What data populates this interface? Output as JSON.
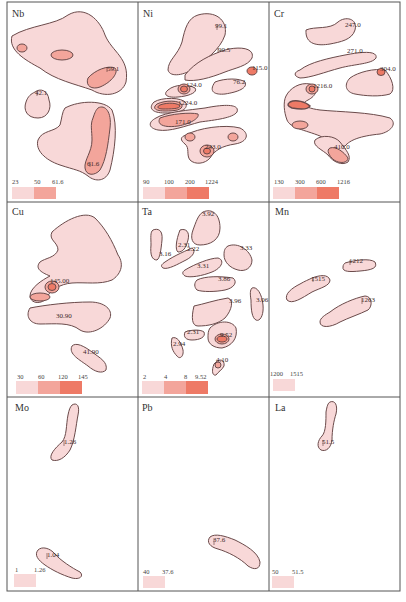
{
  "figure": {
    "grid": {
      "rows": 3,
      "cols": 3
    },
    "colors": {
      "level1": "#f8d8d8",
      "level2": "#f3a59b",
      "level3": "#ee7a66",
      "outline": "#6a4a4a",
      "frame": "#555555"
    },
    "panels": [
      {
        "element": "Nb",
        "legend": [
          "23",
          "50",
          "61.6"
        ],
        "values": [
          "42.1",
          "59.1",
          "61.6"
        ]
      },
      {
        "element": "Ni",
        "legend": [
          "90",
          "100",
          "200",
          "1224"
        ],
        "values": [
          "99.1",
          "90.5",
          "115.0",
          "76.2",
          "124.0",
          "1224.0",
          "171.0",
          "243.0"
        ]
      },
      {
        "element": "Cr",
        "legend": [
          "130",
          "300",
          "600",
          "1216"
        ],
        "values": [
          "247.0",
          "271.0",
          "304.0",
          "1216.0",
          "410.0"
        ]
      },
      {
        "element": "Cu",
        "legend": [
          "30",
          "60",
          "120",
          "145"
        ],
        "values": [
          "145.00",
          "30.90",
          "41.90"
        ]
      },
      {
        "element": "Ta",
        "legend": [
          "2",
          "4",
          "8",
          "9.52"
        ],
        "values": [
          "3.92",
          "2.31",
          "2.22",
          "3.16",
          "3.33",
          "3.31",
          "3.86",
          "3.96",
          "3.06",
          "2.31",
          "9.52",
          "2.94",
          "4.10"
        ]
      },
      {
        "element": "Mn",
        "legend": [
          "1200",
          "1515"
        ],
        "values": [
          "1212",
          "1515",
          "1263"
        ]
      },
      {
        "element": "Mo",
        "legend": [
          "1",
          "1.26"
        ],
        "values": [
          "1.26",
          "1.04"
        ]
      },
      {
        "element": "Pb",
        "legend": [
          "40",
          "37.6"
        ],
        "values": [
          "37.6"
        ]
      },
      {
        "element": "La",
        "legend": [
          "50",
          "51.5"
        ],
        "values": [
          "51.5"
        ]
      }
    ]
  }
}
